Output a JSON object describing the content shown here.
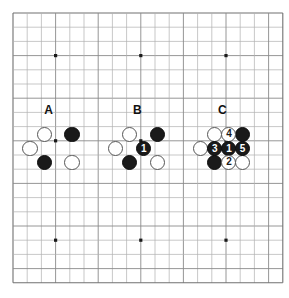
{
  "diagram": {
    "type": "go-board-diagram",
    "title": "",
    "board": {
      "size": 20,
      "origin_x": 13,
      "origin_y": 13,
      "spacing": 14.2,
      "line_color": "#b0b0b0",
      "edge_color": "#707070",
      "major_color": "#8a8a8a",
      "background": "#ffffff",
      "star_point_color": "#1a1a1a",
      "star_points": [
        {
          "col": 3,
          "row": 3
        },
        {
          "col": 9,
          "row": 3
        },
        {
          "col": 15,
          "row": 3
        },
        {
          "col": 3,
          "row": 9
        },
        {
          "col": 9,
          "row": 9
        },
        {
          "col": 15,
          "row": 9
        },
        {
          "col": 3,
          "row": 16
        },
        {
          "col": 9,
          "row": 16
        },
        {
          "col": 15,
          "row": 16
        }
      ]
    },
    "labels": [
      {
        "text": "A",
        "col": 2.5,
        "row": 6.8
      },
      {
        "text": "B",
        "col": 8.75,
        "row": 6.8
      },
      {
        "text": "C",
        "col": 14.75,
        "row": 6.8
      }
    ],
    "groups": [
      {
        "name": "A",
        "stones": [
          {
            "color": "white",
            "col": 2.2,
            "row": 8.55,
            "number": ""
          },
          {
            "color": "black",
            "col": 4.15,
            "row": 8.55,
            "number": ""
          },
          {
            "color": "white",
            "col": 1.2,
            "row": 9.55,
            "number": ""
          },
          {
            "color": "black",
            "col": 2.2,
            "row": 10.5,
            "number": ""
          },
          {
            "color": "white",
            "col": 4.15,
            "row": 10.5,
            "number": ""
          }
        ]
      },
      {
        "name": "B",
        "stones": [
          {
            "color": "white",
            "col": 8.2,
            "row": 8.55,
            "number": ""
          },
          {
            "color": "black",
            "col": 10.15,
            "row": 8.55,
            "number": ""
          },
          {
            "color": "white",
            "col": 7.2,
            "row": 9.55,
            "number": ""
          },
          {
            "color": "black",
            "col": 9.2,
            "row": 9.55,
            "number": "1"
          },
          {
            "color": "black",
            "col": 8.2,
            "row": 10.5,
            "number": ""
          },
          {
            "color": "white",
            "col": 10.15,
            "row": 10.5,
            "number": ""
          }
        ]
      },
      {
        "name": "C",
        "stones": [
          {
            "color": "white",
            "col": 14.2,
            "row": 8.55,
            "number": ""
          },
          {
            "color": "white",
            "col": 15.2,
            "row": 8.55,
            "number": "4"
          },
          {
            "color": "black",
            "col": 16.15,
            "row": 8.55,
            "number": ""
          },
          {
            "color": "white",
            "col": 13.2,
            "row": 9.55,
            "number": ""
          },
          {
            "color": "black",
            "col": 14.2,
            "row": 9.55,
            "number": "3"
          },
          {
            "color": "black",
            "col": 15.2,
            "row": 9.55,
            "number": "1"
          },
          {
            "color": "black",
            "col": 16.15,
            "row": 9.55,
            "number": "5"
          },
          {
            "color": "black",
            "col": 14.2,
            "row": 10.5,
            "number": ""
          },
          {
            "color": "white",
            "col": 15.2,
            "row": 10.5,
            "number": "2"
          },
          {
            "color": "white",
            "col": 16.15,
            "row": 10.5,
            "number": ""
          }
        ]
      }
    ]
  }
}
